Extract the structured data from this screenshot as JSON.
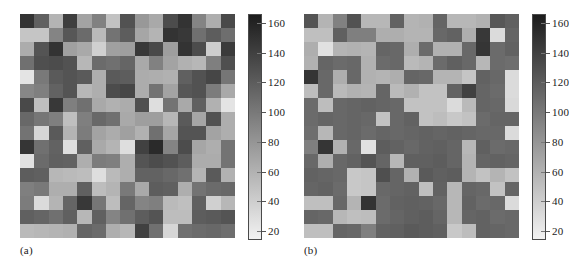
{
  "figure": {
    "type": "two-panel-grayscale-heatmap-figure",
    "background_color": "#ffffff",
    "panel_count": 2
  },
  "panels": [
    {
      "caption": "(a)",
      "name": "panel-a",
      "colorbar": {
        "name": "colorbar-a",
        "orientation": "vertical",
        "colormap": "grayscale-inverted",
        "top_color": "#1c1c1c",
        "bottom_color": "#f2f2f2",
        "vmin": 14,
        "vmax": 166,
        "tick_labels": [
          "160",
          "140",
          "120",
          "100",
          "80",
          "60",
          "40",
          "20"
        ],
        "tick_values": [
          160,
          140,
          120,
          100,
          80,
          60,
          40,
          20
        ]
      }
    },
    {
      "caption": "(b)",
      "name": "panel-b",
      "colorbar": {
        "name": "colorbar-b",
        "orientation": "vertical",
        "colormap": "grayscale-inverted",
        "top_color": "#1c1c1c",
        "bottom_color": "#f2f2f2",
        "vmin": 14,
        "vmax": 166,
        "tick_labels": [
          "160",
          "140",
          "120",
          "100",
          "80",
          "60",
          "40",
          "20"
        ],
        "tick_values": [
          160,
          140,
          120,
          100,
          80,
          60,
          40,
          20
        ]
      }
    }
  ],
  "chart_data": [
    {
      "type": "heatmap",
      "title": "",
      "panel": "(a)",
      "xlabel": "",
      "ylabel": "",
      "grid": false,
      "legend": "colorbar-right",
      "colormap": "grayscale-inverted",
      "rows": 16,
      "cols": 15,
      "vmin": 14,
      "vmax": 166,
      "colorbar_ticks": [
        160,
        140,
        120,
        100,
        80,
        60,
        40,
        20
      ],
      "values": [
        [
          150,
          118,
          58,
          142,
          70,
          94,
          48,
          128,
          78,
          66,
          132,
          150,
          92,
          62,
          134
        ],
        [
          46,
          46,
          92,
          124,
          110,
          54,
          104,
          120,
          68,
          58,
          150,
          146,
          106,
          120,
          108
        ],
        [
          64,
          126,
          150,
          72,
          66,
          38,
          72,
          74,
          146,
          134,
          74,
          150,
          132,
          40,
          144
        ],
        [
          106,
          130,
          132,
          128,
          56,
          110,
          106,
          114,
          66,
          94,
          70,
          60,
          56,
          96,
          130
        ],
        [
          24,
          100,
          122,
          126,
          122,
          62,
          122,
          120,
          64,
          62,
          60,
          118,
          128,
          136,
          102
        ],
        [
          90,
          96,
          116,
          126,
          56,
          62,
          132,
          136,
          64,
          104,
          70,
          124,
          128,
          98,
          66
        ],
        [
          134,
          50,
          146,
          96,
          106,
          66,
          60,
          64,
          130,
          28,
          104,
          66,
          118,
          60,
          24
        ],
        [
          112,
          102,
          96,
          50,
          96,
          112,
          106,
          66,
          74,
          74,
          56,
          122,
          68,
          128,
          62
        ],
        [
          104,
          34,
          122,
          58,
          98,
          70,
          64,
          72,
          60,
          106,
          68,
          126,
          126,
          70,
          62
        ],
        [
          148,
          106,
          116,
          28,
          118,
          66,
          58,
          28,
          140,
          156,
          92,
          132,
          68,
          62,
          104
        ],
        [
          26,
          110,
          118,
          116,
          62,
          98,
          96,
          62,
          126,
          132,
          128,
          120,
          64,
          64,
          104
        ],
        [
          120,
          118,
          56,
          54,
          52,
          28,
          54,
          62,
          116,
          116,
          112,
          106,
          58,
          122,
          60
        ],
        [
          96,
          100,
          62,
          62,
          118,
          52,
          58,
          100,
          66,
          120,
          118,
          62,
          104,
          110,
          112
        ],
        [
          98,
          30,
          58,
          114,
          146,
          102,
          52,
          114,
          92,
          96,
          54,
          50,
          118,
          38,
          56
        ],
        [
          118,
          114,
          106,
          118,
          56,
          118,
          92,
          106,
          120,
          126,
          52,
          52,
          120,
          122,
          126
        ],
        [
          54,
          56,
          58,
          60,
          114,
          110,
          62,
          56,
          140,
          106,
          34,
          106,
          110,
          112,
          108
        ]
      ]
    },
    {
      "type": "heatmap",
      "title": "",
      "panel": "(b)",
      "xlabel": "",
      "ylabel": "",
      "grid": false,
      "legend": "colorbar-right",
      "colormap": "grayscale-inverted",
      "rows": 16,
      "cols": 15,
      "vmin": 14,
      "vmax": 166,
      "colorbar_ticks": [
        160,
        140,
        120,
        100,
        80,
        60,
        40,
        20
      ],
      "values": [
        [
          126,
          58,
          94,
          128,
          56,
          56,
          116,
          58,
          60,
          114,
          56,
          56,
          60,
          124,
          118
        ],
        [
          50,
          50,
          118,
          96,
          96,
          62,
          62,
          58,
          58,
          112,
          116,
          62,
          146,
          30,
          114
        ],
        [
          62,
          26,
          58,
          60,
          58,
          114,
          112,
          62,
          110,
          60,
          60,
          112,
          148,
          110,
          116
        ],
        [
          60,
          114,
          110,
          112,
          60,
          110,
          112,
          54,
          58,
          110,
          118,
          112,
          56,
          110,
          108
        ],
        [
          148,
          112,
          62,
          112,
          60,
          58,
          62,
          114,
          112,
          58,
          58,
          46,
          116,
          112,
          30
        ],
        [
          52,
          112,
          54,
          60,
          58,
          114,
          54,
          60,
          48,
          48,
          116,
          140,
          114,
          110,
          30
        ],
        [
          110,
          52,
          112,
          114,
          116,
          114,
          112,
          48,
          48,
          48,
          30,
          54,
          114,
          112,
          32
        ],
        [
          110,
          114,
          112,
          114,
          112,
          48,
          112,
          116,
          48,
          52,
          44,
          48,
          110,
          114,
          114
        ],
        [
          108,
          56,
          112,
          114,
          110,
          114,
          112,
          114,
          116,
          114,
          116,
          114,
          112,
          112,
          30
        ],
        [
          96,
          148,
          60,
          112,
          26,
          120,
          116,
          112,
          116,
          118,
          114,
          56,
          118,
          110,
          112
        ],
        [
          112,
          62,
          112,
          116,
          126,
          114,
          56,
          118,
          118,
          120,
          114,
          58,
          114,
          116,
          114
        ],
        [
          116,
          114,
          112,
          44,
          46,
          130,
          114,
          60,
          122,
          118,
          120,
          58,
          48,
          58,
          48
        ],
        [
          114,
          116,
          110,
          44,
          46,
          112,
          114,
          116,
          50,
          116,
          56,
          114,
          112,
          48,
          114
        ],
        [
          50,
          50,
          112,
          58,
          150,
          110,
          116,
          118,
          116,
          112,
          56,
          116,
          110,
          112,
          30
        ],
        [
          114,
          112,
          56,
          50,
          52,
          110,
          114,
          118,
          120,
          114,
          56,
          114,
          116,
          110,
          112
        ],
        [
          50,
          50,
          114,
          112,
          96,
          116,
          118,
          122,
          120,
          118,
          44,
          52,
          116,
          114,
          112
        ]
      ]
    }
  ]
}
